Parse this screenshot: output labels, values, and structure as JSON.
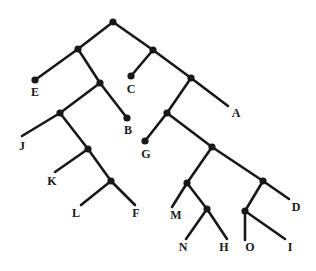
{
  "figure": {
    "type": "cladogram",
    "title": "",
    "background_color": "#ffffff",
    "line_color": "#18181a",
    "node_color": "#18181a",
    "label_color": "#1a1a1c",
    "width": 316,
    "height": 271
  },
  "chart_data": {
    "type": "diagram",
    "subtype": "phylogenetic-tree",
    "title": "",
    "leaf_labels": [
      "E",
      "C",
      "A",
      "B",
      "J",
      "G",
      "K",
      "L",
      "F",
      "M",
      "N",
      "H",
      "O",
      "I",
      "D"
    ],
    "leaves": [
      {
        "id": "E",
        "label": "E",
        "x": 35,
        "y": 80,
        "label_x": 35,
        "label_y": 86,
        "tip": "dot"
      },
      {
        "id": "C",
        "label": "C",
        "x": 131,
        "y": 76,
        "label_x": 131,
        "label_y": 83,
        "tip": "dot"
      },
      {
        "id": "A",
        "label": "A",
        "x": 228,
        "y": 106,
        "label_x": 236,
        "label_y": 107,
        "tip": "open"
      },
      {
        "id": "B",
        "label": "B",
        "x": 127,
        "y": 118,
        "label_x": 128,
        "label_y": 124,
        "tip": "dot"
      },
      {
        "id": "J",
        "label": "J",
        "x": 22,
        "y": 136,
        "label_x": 22,
        "label_y": 140,
        "tip": "open"
      },
      {
        "id": "G",
        "label": "G",
        "x": 145,
        "y": 141,
        "label_x": 146,
        "label_y": 148,
        "tip": "dot"
      },
      {
        "id": "K",
        "label": "K",
        "x": 55,
        "y": 172,
        "label_x": 52,
        "label_y": 175,
        "tip": "open"
      },
      {
        "id": "L",
        "label": "L",
        "x": 81,
        "y": 205,
        "label_x": 76,
        "label_y": 207,
        "tip": "open"
      },
      {
        "id": "F",
        "label": "F",
        "x": 135,
        "y": 205,
        "label_x": 136,
        "label_y": 207,
        "tip": "open"
      },
      {
        "id": "M",
        "label": "M",
        "x": 172,
        "y": 207,
        "label_x": 176,
        "label_y": 209,
        "tip": "open"
      },
      {
        "id": "N",
        "label": "N",
        "x": 186,
        "y": 239,
        "label_x": 183,
        "label_y": 241,
        "tip": "open"
      },
      {
        "id": "H",
        "label": "H",
        "x": 227,
        "y": 239,
        "label_x": 224,
        "label_y": 241,
        "tip": "open"
      },
      {
        "id": "O",
        "label": "O",
        "x": 245,
        "y": 240,
        "label_x": 250,
        "label_y": 241,
        "tip": "open"
      },
      {
        "id": "I",
        "label": "I",
        "x": 285,
        "y": 239,
        "label_x": 290,
        "label_y": 241,
        "tip": "open"
      },
      {
        "id": "D",
        "label": "D",
        "x": 289,
        "y": 199,
        "label_x": 296,
        "label_y": 201,
        "tip": "open"
      }
    ],
    "internal_nodes": [
      {
        "id": "root",
        "x": 113,
        "y": 22
      },
      {
        "id": "n1",
        "x": 78,
        "y": 49
      },
      {
        "id": "n2",
        "x": 153,
        "y": 50
      },
      {
        "id": "n3",
        "x": 100,
        "y": 83
      },
      {
        "id": "n4",
        "x": 191,
        "y": 78
      },
      {
        "id": "n5",
        "x": 60,
        "y": 113
      },
      {
        "id": "n6",
        "x": 167,
        "y": 113
      },
      {
        "id": "n7",
        "x": 88,
        "y": 149
      },
      {
        "id": "n8",
        "x": 212,
        "y": 147
      },
      {
        "id": "n9",
        "x": 111,
        "y": 181
      },
      {
        "id": "n10",
        "x": 187,
        "y": 183
      },
      {
        "id": "n11",
        "x": 263,
        "y": 181
      },
      {
        "id": "n12",
        "x": 207,
        "y": 209
      },
      {
        "id": "n13",
        "x": 245,
        "y": 211
      }
    ],
    "edges": [
      {
        "from": "root",
        "to": "n1"
      },
      {
        "from": "root",
        "to": "n2"
      },
      {
        "from": "n1",
        "to": "E"
      },
      {
        "from": "n1",
        "to": "n3"
      },
      {
        "from": "n2",
        "to": "C"
      },
      {
        "from": "n2",
        "to": "n4"
      },
      {
        "from": "n3",
        "to": "n5"
      },
      {
        "from": "n3",
        "to": "B"
      },
      {
        "from": "n4",
        "to": "n6"
      },
      {
        "from": "n4",
        "to": "A"
      },
      {
        "from": "n5",
        "to": "J"
      },
      {
        "from": "n5",
        "to": "n7"
      },
      {
        "from": "n6",
        "to": "G"
      },
      {
        "from": "n6",
        "to": "n8"
      },
      {
        "from": "n7",
        "to": "K"
      },
      {
        "from": "n7",
        "to": "n9"
      },
      {
        "from": "n8",
        "to": "n10"
      },
      {
        "from": "n8",
        "to": "n11"
      },
      {
        "from": "n9",
        "to": "L"
      },
      {
        "from": "n9",
        "to": "F"
      },
      {
        "from": "n10",
        "to": "M"
      },
      {
        "from": "n10",
        "to": "n12"
      },
      {
        "from": "n11",
        "to": "n13"
      },
      {
        "from": "n11",
        "to": "D"
      },
      {
        "from": "n12",
        "to": "N"
      },
      {
        "from": "n12",
        "to": "H"
      },
      {
        "from": "n13",
        "to": "O"
      },
      {
        "from": "n13",
        "to": "I"
      }
    ]
  }
}
